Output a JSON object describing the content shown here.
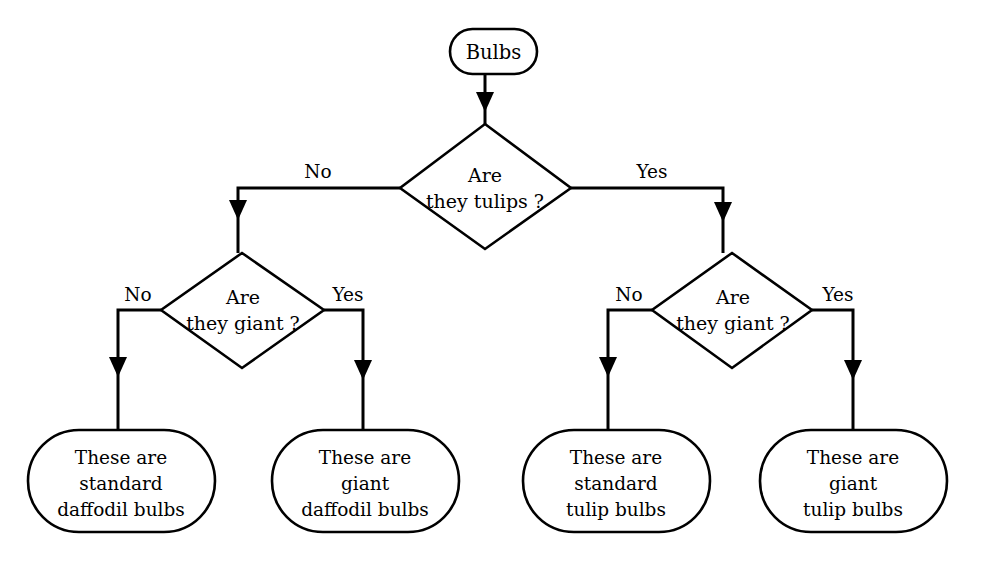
{
  "diagram": {
    "type": "flowchart",
    "orientation": "top-down",
    "background_color": "#ffffff",
    "line_color": "#000000",
    "text_color": "#000000"
  },
  "nodes": {
    "start": {
      "id": "start",
      "shape": "stadium",
      "label": "Bulbs"
    },
    "decision_tulips": {
      "id": "decision_tulips",
      "shape": "diamond",
      "line1": "Are",
      "line2": "they tulips ?"
    },
    "decision_giant_left": {
      "id": "decision_giant_left",
      "shape": "diamond",
      "line1": "Are",
      "line2": "they giant ?"
    },
    "decision_giant_right": {
      "id": "decision_giant_right",
      "shape": "diamond",
      "line1": "Are",
      "line2": "they giant ?"
    },
    "result_standard_daffodil": {
      "id": "result_standard_daffodil",
      "shape": "stadium",
      "line1": "These are",
      "line2": "standard",
      "line3": "daffodil bulbs"
    },
    "result_giant_daffodil": {
      "id": "result_giant_daffodil",
      "shape": "stadium",
      "line1": "These are",
      "line2": "giant",
      "line3": "daffodil bulbs"
    },
    "result_standard_tulip": {
      "id": "result_standard_tulip",
      "shape": "stadium",
      "line1": "These are",
      "line2": "standard",
      "line3": "tulip bulbs"
    },
    "result_giant_tulip": {
      "id": "result_giant_tulip",
      "shape": "stadium",
      "line1": "These are",
      "line2": "giant",
      "line3": "tulip bulbs"
    }
  },
  "edges": {
    "start_to_tulips": {
      "label": ""
    },
    "tulips_no": {
      "label": "No"
    },
    "tulips_yes": {
      "label": "Yes"
    },
    "giant_left_no": {
      "label": "No"
    },
    "giant_left_yes": {
      "label": "Yes"
    },
    "giant_right_no": {
      "label": "No"
    },
    "giant_right_yes": {
      "label": "Yes"
    }
  }
}
